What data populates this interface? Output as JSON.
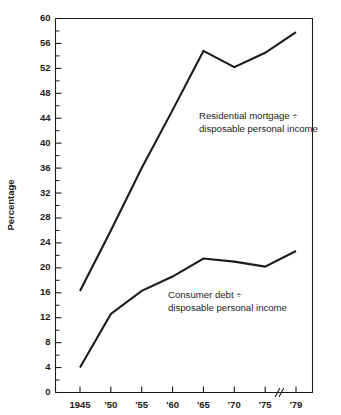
{
  "chart_data": {
    "type": "line",
    "title": "",
    "subtitle": "",
    "xlabel": "",
    "ylabel": "Percentage",
    "ylim": [
      0,
      60
    ],
    "xlim": [
      1945,
      1979
    ],
    "grid": false,
    "legend_position": "inline-annotation",
    "x": [
      1945,
      1950,
      1955,
      1960,
      1965,
      1970,
      1975,
      1979
    ],
    "x_tick_labels": [
      "1945",
      "'50",
      "'55",
      "'60",
      "'65",
      "'70",
      "'75",
      "'79"
    ],
    "y_tick_labels": [
      "0",
      "4",
      "8",
      "12",
      "16",
      "20",
      "24",
      "28",
      "32",
      "36",
      "40",
      "44",
      "48",
      "52",
      "56",
      "60"
    ],
    "y_tick_values": [
      0,
      4,
      8,
      12,
      16,
      20,
      24,
      28,
      32,
      36,
      40,
      44,
      48,
      52,
      56,
      60
    ],
    "y_minor_step": 2,
    "axis_break": {
      "present": true,
      "symbol": "//",
      "between": [
        "'75",
        "'79"
      ]
    },
    "series": [
      {
        "name": "Residential mortgage ÷ disposable personal income",
        "values": [
          16.3,
          26.0,
          36.0,
          45.3,
          54.8,
          52.2,
          54.5,
          57.8
        ],
        "annotation_line1": "Residential mortgage ÷",
        "annotation_line2": "disposable personal income"
      },
      {
        "name": "Consumer debt ÷ disposable personal income",
        "values": [
          4.0,
          12.6,
          16.3,
          18.6,
          21.5,
          21.0,
          20.2,
          22.7
        ],
        "annotation_line1": "Consumer debt ÷",
        "annotation_line2": "disposable personal income"
      }
    ],
    "colors": {
      "line": "#1b1b1b",
      "axis": "#1b1b1b",
      "background": "#ffffff"
    }
  }
}
